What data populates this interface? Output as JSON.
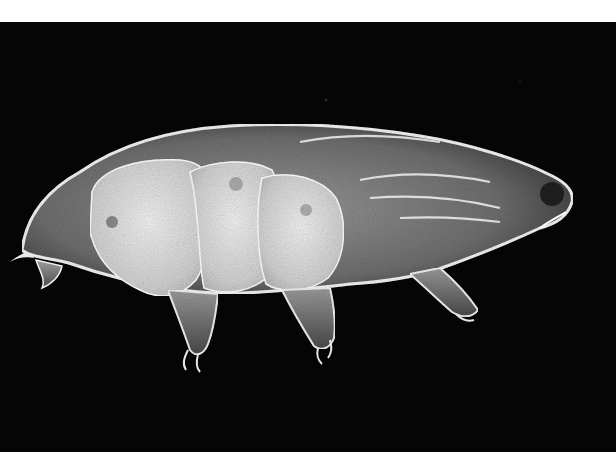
{
  "image": {
    "subject": "tardigrade (water bear) micrograph",
    "description": "Dark-field microscopy image of a tardigrade viewed from the side, body oriented horizontally with head at right, on a black background framed by white strips at top and bottom",
    "background_color": "#050505",
    "frame_color": "#ffffff",
    "specimen_color": "#e6e6e6"
  }
}
